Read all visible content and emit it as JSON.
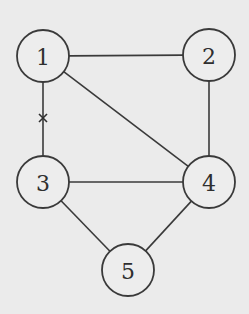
{
  "diagram": {
    "type": "undirected-graph",
    "background": "#ebebeb",
    "stroke_color": "#3a3a3a",
    "nodes": [
      {
        "id": "1",
        "label": "1",
        "cx": 43,
        "cy": 56,
        "r": 26
      },
      {
        "id": "2",
        "label": "2",
        "cx": 209,
        "cy": 55,
        "r": 26
      },
      {
        "id": "3",
        "label": "3",
        "cx": 43,
        "cy": 182,
        "r": 26
      },
      {
        "id": "4",
        "label": "4",
        "cx": 209,
        "cy": 182,
        "r": 26
      },
      {
        "id": "5",
        "label": "5",
        "cx": 128,
        "cy": 270,
        "r": 26
      }
    ],
    "edges": [
      {
        "from": "1",
        "to": "2"
      },
      {
        "from": "1",
        "to": "3",
        "marked": true,
        "mark": "×"
      },
      {
        "from": "1",
        "to": "4"
      },
      {
        "from": "2",
        "to": "4"
      },
      {
        "from": "3",
        "to": "4"
      },
      {
        "from": "3",
        "to": "5"
      },
      {
        "from": "4",
        "to": "5"
      }
    ],
    "marks": [
      {
        "symbol": "×",
        "on_edge": "1-3",
        "x": 43,
        "y": 118
      }
    ]
  }
}
